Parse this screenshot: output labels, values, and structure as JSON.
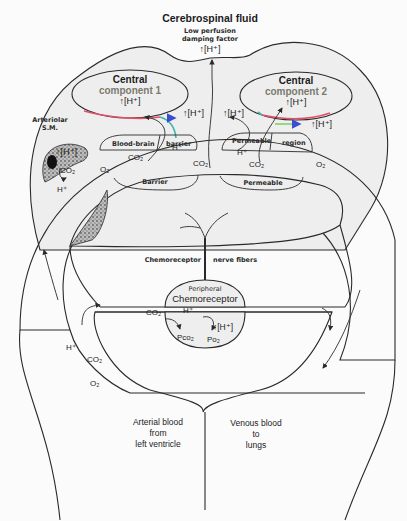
{
  "title": "Cerebrospinal fluid",
  "csf_note": {
    "line1": "Low perfusion",
    "line2": "damping factor",
    "h_ion": "↑[H⁺]"
  },
  "central_component_1": {
    "line1": "Central",
    "line2": "component 1",
    "h_ion": "↑[H⁺]",
    "outflow_h_ion": "↑[H⁺]"
  },
  "central_component_2": {
    "line1": "Central",
    "line2": "component 2",
    "h_ion": "↑[H⁺]",
    "left_h_ion": "↑[H⁺]",
    "outflow_h_ion": "↑[H⁺]"
  },
  "arteriolar": {
    "line1": "Arteriolar",
    "line2": "S.M.",
    "h_ion": "↑[H⁺]",
    "co2": "CO₂"
  },
  "upper_barriers": {
    "blood_brain": "Blood-brain",
    "barrier": "barrier",
    "permeable": "Permeable",
    "region": "region"
  },
  "lower_barriers": {
    "barrier": "Barrier",
    "permeable": "Permeable"
  },
  "upper_vessel_labels": {
    "co2_left": "CO₂",
    "o2_left": "O₂",
    "co2_bbb": "CO₂",
    "h_bbb": "H⁺",
    "co2_center": "CO₂",
    "h_perm": "H⁺",
    "co2_perm": "CO₂",
    "o2_right": "O₂",
    "h_left_lower": "H⁺"
  },
  "nerve": {
    "left": "Chemoreceptor",
    "right": "nerve fibers"
  },
  "peripheral": {
    "line1": "Peripheral",
    "line2": "Chemoreceptor",
    "co2": "CO₂",
    "h": "H⁺",
    "h_ion": "↑[H⁺]",
    "pco2": "Pco₂",
    "po2": "Po₂"
  },
  "left_channel": {
    "h": "H⁺",
    "co2": "CO₂",
    "o2": "O₂"
  },
  "arterial": {
    "line1": "Arterial blood",
    "line2": "from",
    "line3": "left ventricle"
  },
  "venous": {
    "line1": "Venous blood",
    "line2": "to",
    "line3": "lungs"
  },
  "colors": {
    "background": "#fbfbfb",
    "csf_fill": "#eeeeee",
    "line": "#2a2a2a",
    "membrane_red": "#e0506a",
    "membrane_teal": "#3fb7a8",
    "membrane_green": "#7ed36a",
    "arrow_blue": "#3a4fd0",
    "component_text": "#7a7a6e"
  }
}
